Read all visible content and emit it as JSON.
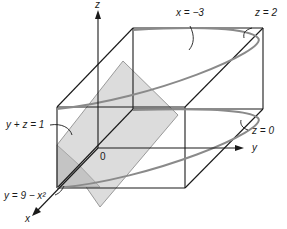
{
  "figure": {
    "axes": {
      "x": "x",
      "y": "y",
      "z": "z",
      "origin": "0"
    },
    "labels": {
      "x_eq": "x = −3",
      "z_top": "z = 2",
      "z_bottom": "z = 0",
      "plane": "y + z = 1",
      "parabola": "y = 9 − x²"
    },
    "colors": {
      "line": "#1a1a1a",
      "parabola": "#8a8a8a",
      "plane_fill": "#dcdcdc",
      "plane_dark": "#bdbdbd"
    }
  }
}
